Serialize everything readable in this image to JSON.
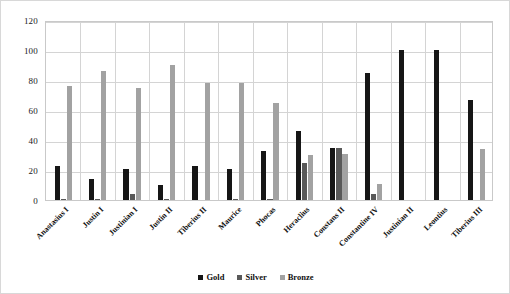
{
  "chart_data": {
    "type": "bar",
    "title": "",
    "subtitle": "",
    "xlabel": "",
    "ylabel": "",
    "ylim": [
      0,
      120
    ],
    "yticks": [
      0,
      20,
      40,
      60,
      80,
      100,
      120
    ],
    "grid": true,
    "legend_position": "bottom-center",
    "categories": [
      "Anastasius I",
      "Justin I",
      "Justinian I",
      "Justin II",
      "Tiberius II",
      "Maurice",
      "Phocas",
      "Heraclius",
      "Constans II",
      "Constantine IV",
      "Justinian II",
      "Leontius",
      "Tiberius III"
    ],
    "series": [
      {
        "name": "Gold",
        "color": "#161616",
        "values": [
          23,
          14,
          21,
          10,
          23,
          21,
          33,
          46,
          35,
          85,
          100,
          100,
          67
        ]
      },
      {
        "name": "Silver",
        "color": "#595959",
        "values": [
          1,
          1,
          4,
          0.5,
          0,
          1,
          1,
          25,
          35,
          4,
          0,
          0,
          0
        ]
      },
      {
        "name": "Bronze",
        "color": "#a2a2a2",
        "values": [
          76,
          86,
          75,
          90,
          78,
          78,
          65,
          30,
          31,
          11,
          0,
          0,
          34
        ]
      }
    ]
  },
  "legend": {
    "items": [
      {
        "label": "Gold",
        "color": "#161616"
      },
      {
        "label": "Silver",
        "color": "#595959"
      },
      {
        "label": "Bronze",
        "color": "#a2a2a2"
      }
    ]
  }
}
